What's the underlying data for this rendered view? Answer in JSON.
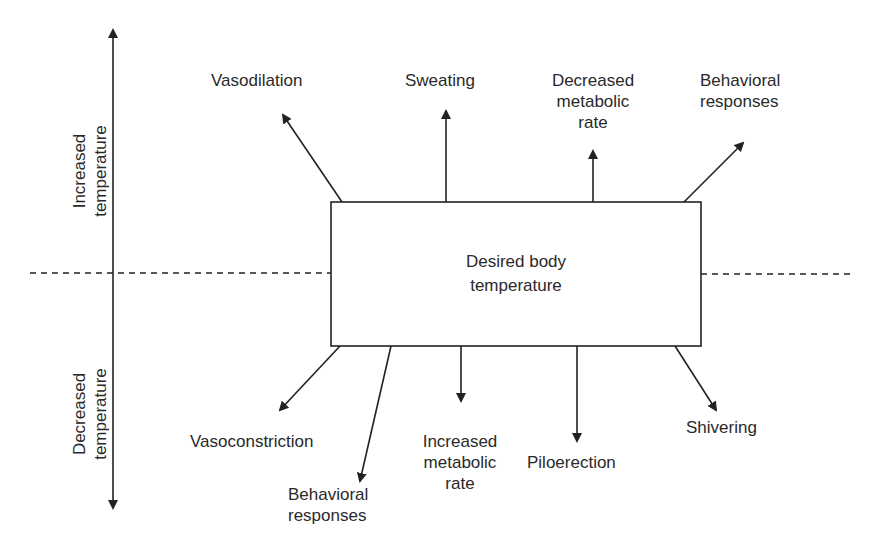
{
  "diagram": {
    "center": {
      "line1": "Desired body",
      "line2": "temperature"
    },
    "axis": {
      "upper": {
        "line1": "Increased",
        "line2": "temperature"
      },
      "lower": {
        "line1": "Decreased",
        "line2": "temperature"
      }
    },
    "increase_responses": [
      {
        "lines": [
          "Vasodilation"
        ]
      },
      {
        "lines": [
          "Sweating"
        ]
      },
      {
        "lines": [
          "Decreased",
          "metabolic",
          "rate"
        ]
      },
      {
        "lines": [
          "Behavioral",
          "responses"
        ]
      }
    ],
    "decrease_responses": [
      {
        "lines": [
          "Vasoconstriction"
        ]
      },
      {
        "lines": [
          "Behavioral",
          "responses"
        ]
      },
      {
        "lines": [
          "Increased",
          "metabolic",
          "rate"
        ]
      },
      {
        "lines": [
          "Piloerection"
        ]
      },
      {
        "lines": [
          "Shivering"
        ]
      }
    ],
    "colors": {
      "line": "#222222",
      "background": "#ffffff"
    }
  }
}
